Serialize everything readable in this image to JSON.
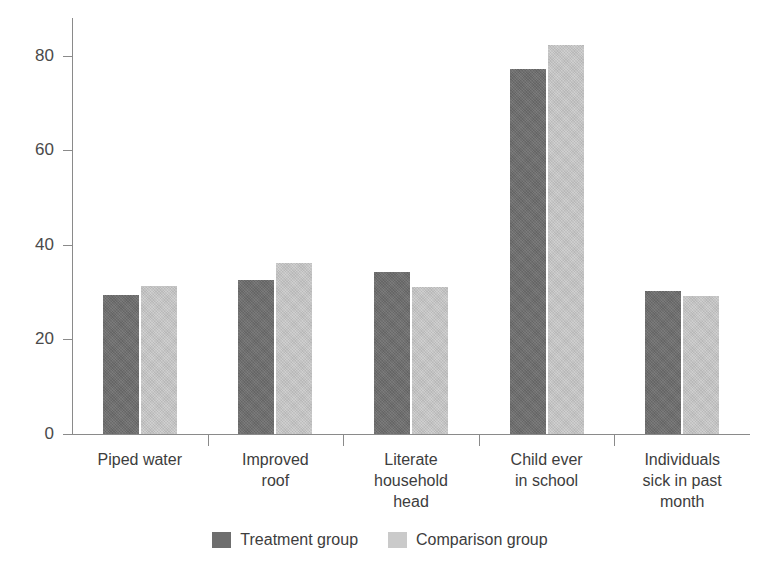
{
  "chart_data": {
    "type": "bar",
    "title": "",
    "subtitle": "",
    "xlabel": "",
    "ylabel": "Percent",
    "ylim": [
      0,
      88
    ],
    "yticks": [
      0,
      20,
      40,
      60,
      80
    ],
    "ytick_labels": [
      "0",
      "20",
      "40",
      "60",
      "80"
    ],
    "grid": false,
    "legend_position": "bottom-center",
    "categories": [
      "Piped water",
      "Improved roof",
      "Literate household head",
      "Child ever in school",
      "Individuals sick in past month"
    ],
    "category_lines": [
      [
        "Piped water"
      ],
      [
        "Improved",
        "roof"
      ],
      [
        "Literate",
        "household",
        "head"
      ],
      [
        "Child ever",
        "in school"
      ],
      [
        "Individuals",
        "sick in past",
        "month"
      ]
    ],
    "series": [
      {
        "name": "Treatment group",
        "color": "#6e6e6e",
        "values": [
          29.4,
          32.5,
          34.3,
          77.3,
          30.2
        ]
      },
      {
        "name": "Comparison group",
        "color": "#cacaca",
        "values": [
          31.4,
          36.2,
          31.2,
          82.3,
          29.1
        ]
      }
    ]
  },
  "axis": {
    "y_title": "Percent"
  },
  "legend": {
    "items": [
      {
        "label": "Treatment group",
        "color": "#6e6e6e"
      },
      {
        "label": "Comparison group",
        "color": "#cacaca"
      }
    ]
  }
}
